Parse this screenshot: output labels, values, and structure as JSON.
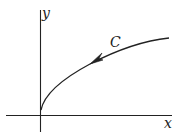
{
  "diagram": {
    "type": "coordinate-plane-with-oriented-curve",
    "axes": {
      "x_label": "x",
      "y_label": "y",
      "color": "#222222"
    },
    "curve": {
      "label": "C",
      "shape": "square-root-like concave curve starting near origin on y-axis, rising to the right",
      "orientation": "arrow points toward origin (from right end to left end)",
      "color": "#222222"
    }
  }
}
